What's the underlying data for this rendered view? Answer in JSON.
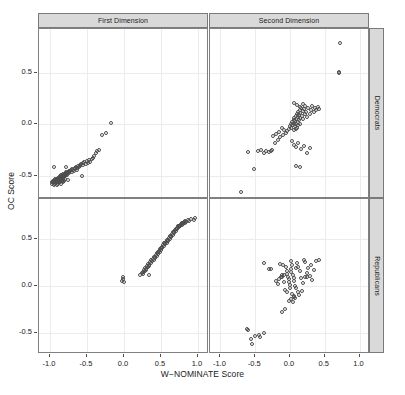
{
  "chart_data": {
    "type": "scatter",
    "title": "",
    "xlabel": "W−NOMINATE Score",
    "ylabel": "OC Score",
    "xlim": [
      -1.15,
      1.15
    ],
    "ylim": [
      -0.72,
      0.92
    ],
    "grid": true,
    "legend": null,
    "layout": {
      "rows": 2,
      "cols": 2,
      "col_strips": [
        "First Dimension",
        "Second Dimension"
      ],
      "row_strips": [
        "Democrats",
        "Republicans"
      ]
    },
    "xticks": [
      -1.0,
      -0.5,
      0.0,
      0.5,
      1.0
    ],
    "xtick_labels": [
      "-1.0",
      "-0.5",
      "0.0",
      "0.5",
      "1.0"
    ],
    "yticks": [
      0.5,
      0.0,
      -0.5
    ],
    "ytick_labels": [
      "0.5",
      "0.0",
      "-0.5"
    ],
    "marker": "open-circle",
    "marker_color": "#4d4d4d",
    "panels": [
      {
        "row": 0,
        "col": 0,
        "row_label": "Democrats",
        "col_label": "First Dimension",
        "x": [
          -0.96,
          -0.95,
          -0.94,
          -0.94,
          -0.93,
          -0.93,
          -0.92,
          -0.92,
          -0.91,
          -0.91,
          -0.9,
          -0.9,
          -0.9,
          -0.89,
          -0.89,
          -0.88,
          -0.88,
          -0.88,
          -0.87,
          -0.87,
          -0.86,
          -0.86,
          -0.86,
          -0.85,
          -0.85,
          -0.85,
          -0.84,
          -0.84,
          -0.83,
          -0.83,
          -0.82,
          -0.82,
          -0.81,
          -0.81,
          -0.8,
          -0.8,
          -0.79,
          -0.79,
          -0.78,
          -0.78,
          -0.77,
          -0.77,
          -0.76,
          -0.75,
          -0.75,
          -0.74,
          -0.73,
          -0.72,
          -0.71,
          -0.7,
          -0.69,
          -0.68,
          -0.67,
          -0.66,
          -0.65,
          -0.64,
          -0.63,
          -0.62,
          -0.61,
          -0.6,
          -0.59,
          -0.58,
          -0.57,
          -0.56,
          -0.55,
          -0.54,
          -0.52,
          -0.5,
          -0.49,
          -0.47,
          -0.46,
          -0.44,
          -0.42,
          -0.4,
          -0.38,
          -0.36,
          -0.34,
          -0.3,
          -0.24,
          -0.98,
          -0.97,
          -0.96,
          -0.95,
          -0.94,
          -0.93,
          -0.92,
          -0.91,
          -0.9,
          -0.89,
          -0.88,
          -0.87,
          -0.86,
          -0.85,
          -0.84,
          -0.83,
          -0.82,
          -0.81,
          -0.8,
          -0.78,
          -0.76
        ],
        "y": [
          -0.56,
          -0.55,
          -0.57,
          -0.54,
          -0.55,
          -0.53,
          -0.56,
          -0.54,
          -0.55,
          -0.53,
          -0.54,
          -0.52,
          -0.56,
          -0.53,
          -0.55,
          -0.52,
          -0.54,
          -0.56,
          -0.51,
          -0.53,
          -0.52,
          -0.54,
          -0.5,
          -0.51,
          -0.53,
          -0.49,
          -0.52,
          -0.5,
          -0.51,
          -0.49,
          -0.5,
          -0.48,
          -0.49,
          -0.51,
          -0.48,
          -0.5,
          -0.47,
          -0.49,
          -0.48,
          -0.46,
          -0.47,
          -0.49,
          -0.46,
          -0.47,
          -0.45,
          -0.46,
          -0.45,
          -0.44,
          -0.46,
          -0.43,
          -0.44,
          -0.45,
          -0.42,
          -0.43,
          -0.41,
          -0.44,
          -0.42,
          -0.4,
          -0.41,
          -0.39,
          -0.4,
          -0.38,
          -0.5,
          -0.37,
          -0.39,
          -0.36,
          -0.38,
          -0.35,
          -0.37,
          -0.34,
          -0.36,
          -0.33,
          -0.32,
          -0.3,
          -0.28,
          -0.26,
          -0.25,
          -0.1,
          -0.08,
          -0.57,
          -0.56,
          -0.55,
          -0.58,
          -0.56,
          -0.57,
          -0.55,
          -0.58,
          -0.56,
          -0.57,
          -0.55,
          -0.56,
          -0.54,
          -0.57,
          -0.55,
          -0.56,
          -0.54,
          -0.55,
          -0.53,
          -0.41,
          -0.54
        ],
        "extra_points": [
          {
            "x": -0.17,
            "y": 0.01
          },
          {
            "x": -0.95,
            "y": -0.41
          }
        ]
      },
      {
        "row": 0,
        "col": 1,
        "row_label": "Democrats",
        "col_label": "Second Dimension",
        "x": [
          -0.04,
          -0.02,
          0.0,
          0.01,
          0.02,
          0.03,
          0.04,
          0.05,
          0.05,
          0.06,
          0.06,
          0.07,
          0.07,
          0.08,
          0.08,
          0.09,
          0.09,
          0.1,
          0.1,
          0.11,
          0.11,
          0.12,
          0.12,
          0.13,
          0.13,
          0.14,
          0.14,
          0.15,
          0.15,
          0.16,
          0.17,
          0.18,
          0.19,
          0.2,
          0.21,
          0.22,
          0.23,
          0.24,
          0.26,
          0.28,
          0.3,
          0.32,
          0.34,
          0.36,
          0.38,
          0.4,
          0.42,
          -0.06,
          -0.08,
          -0.1,
          -0.12,
          -0.14,
          -0.16,
          -0.18,
          -0.2,
          -0.22,
          -0.24,
          -0.26,
          -0.28,
          -0.3,
          -0.34,
          -0.38,
          -0.42,
          -0.46,
          -0.52,
          -0.6,
          -0.7,
          0.03,
          0.05,
          0.09,
          0.12,
          0.16,
          0.2,
          0.24,
          0.28,
          0.06,
          0.1,
          0.14,
          0.18,
          0.08
        ],
        "y": [
          -0.06,
          -0.04,
          -0.02,
          0.0,
          -0.03,
          0.02,
          -0.01,
          0.04,
          -0.05,
          0.01,
          0.06,
          -0.02,
          0.03,
          0.08,
          -0.04,
          0.05,
          0.0,
          0.1,
          -0.03,
          0.07,
          0.02,
          0.12,
          -0.01,
          0.09,
          0.04,
          0.14,
          0.0,
          0.11,
          0.06,
          0.16,
          0.08,
          0.13,
          0.05,
          0.15,
          0.1,
          0.18,
          0.12,
          0.07,
          0.16,
          0.1,
          0.14,
          0.18,
          0.12,
          0.16,
          0.14,
          0.17,
          0.15,
          -0.08,
          -0.05,
          -0.1,
          -0.03,
          -0.12,
          -0.07,
          -0.15,
          -0.09,
          -0.18,
          -0.11,
          -0.25,
          -0.26,
          -0.27,
          -0.26,
          -0.28,
          -0.25,
          -0.26,
          -0.43,
          -0.27,
          -0.65,
          -0.16,
          -0.2,
          -0.22,
          -0.18,
          -0.24,
          -0.21,
          -0.28,
          -0.23,
          0.21,
          0.19,
          0.17,
          0.2,
          -0.4
        ],
        "extra_points": [
          {
            "x": 0.72,
            "y": 0.79
          },
          {
            "x": 0.7,
            "y": 0.51
          },
          {
            "x": 0.7,
            "y": 0.5
          },
          {
            "x": 0.14,
            "y": -0.41
          }
        ]
      },
      {
        "row": 1,
        "col": 0,
        "row_label": "Republicans",
        "col_label": "First Dimension",
        "x": [
          0.22,
          0.24,
          0.26,
          0.27,
          0.28,
          0.29,
          0.3,
          0.31,
          0.32,
          0.33,
          0.34,
          0.35,
          0.36,
          0.37,
          0.38,
          0.39,
          0.4,
          0.41,
          0.42,
          0.43,
          0.44,
          0.45,
          0.46,
          0.47,
          0.48,
          0.49,
          0.5,
          0.51,
          0.52,
          0.53,
          0.54,
          0.55,
          0.56,
          0.57,
          0.58,
          0.59,
          0.6,
          0.61,
          0.62,
          0.63,
          0.64,
          0.65,
          0.66,
          0.67,
          0.68,
          0.69,
          0.7,
          0.71,
          0.72,
          0.73,
          0.74,
          0.75,
          0.76,
          0.77,
          0.78,
          0.79,
          0.8,
          0.81,
          0.82,
          0.83,
          0.84,
          0.86,
          0.88,
          0.9,
          0.94,
          0.96,
          0.26,
          0.3,
          0.34,
          0.38,
          0.42,
          0.46,
          0.5,
          0.54,
          0.58,
          0.62,
          0.66,
          0.7,
          0.74,
          0.78
        ],
        "y": [
          0.12,
          0.14,
          0.15,
          0.17,
          0.16,
          0.19,
          0.18,
          0.21,
          0.2,
          0.23,
          0.22,
          0.25,
          0.24,
          0.27,
          0.26,
          0.29,
          0.28,
          0.31,
          0.3,
          0.33,
          0.32,
          0.35,
          0.34,
          0.37,
          0.36,
          0.39,
          0.38,
          0.41,
          0.4,
          0.43,
          0.42,
          0.45,
          0.44,
          0.47,
          0.46,
          0.49,
          0.48,
          0.51,
          0.5,
          0.53,
          0.52,
          0.55,
          0.54,
          0.57,
          0.56,
          0.59,
          0.58,
          0.61,
          0.6,
          0.63,
          0.62,
          0.64,
          0.63,
          0.66,
          0.65,
          0.67,
          0.66,
          0.68,
          0.67,
          0.69,
          0.68,
          0.7,
          0.69,
          0.71,
          0.7,
          0.72,
          0.13,
          0.17,
          0.21,
          0.26,
          0.31,
          0.36,
          0.4,
          0.45,
          0.49,
          0.53,
          0.57,
          0.6,
          0.64,
          0.67
        ],
        "extra_points": [
          {
            "x": -0.02,
            "y": 0.07
          },
          {
            "x": -0.01,
            "y": 0.1
          },
          {
            "x": -0.03,
            "y": 0.05
          },
          {
            "x": 0.0,
            "y": 0.04
          },
          {
            "x": 0.34,
            "y": 0.12
          }
        ]
      },
      {
        "row": 1,
        "col": 1,
        "row_label": "Republicans",
        "col_label": "Second Dimension",
        "x": [
          -0.38,
          -0.3,
          -0.28,
          -0.15,
          -0.13,
          -0.11,
          -0.1,
          -0.08,
          -0.06,
          -0.05,
          -0.04,
          -0.03,
          -0.02,
          -0.01,
          0.0,
          0.0,
          0.01,
          0.02,
          0.02,
          0.03,
          0.04,
          0.05,
          0.06,
          0.07,
          0.08,
          0.1,
          0.12,
          0.14,
          0.16,
          0.18,
          0.2,
          0.22,
          0.24,
          0.26,
          0.28,
          0.3,
          0.32,
          0.34,
          0.38,
          0.42,
          -0.2,
          -0.18,
          -0.16,
          -0.12,
          -0.09,
          -0.07,
          -0.05,
          0.03,
          0.05,
          0.07,
          0.09,
          0.11,
          0.13,
          0.17,
          0.21,
          0.25,
          -0.02,
          0.01,
          0.04,
          0.06
        ],
        "y": [
          0.24,
          0.18,
          0.18,
          0.23,
          0.09,
          0.09,
          0.22,
          0.12,
          0.2,
          0.16,
          0.13,
          0.1,
          0.07,
          0.04,
          0.01,
          -0.02,
          0.18,
          0.15,
          0.26,
          0.22,
          0.12,
          0.08,
          0.05,
          0.0,
          0.19,
          0.24,
          0.2,
          0.16,
          0.08,
          0.03,
          0.28,
          0.25,
          0.14,
          0.19,
          0.11,
          0.22,
          0.06,
          0.17,
          0.26,
          0.27,
          0.05,
          0.02,
          0.07,
          0.12,
          0.04,
          -0.04,
          -0.06,
          -0.08,
          -0.11,
          -0.13,
          -0.02,
          -0.06,
          -0.09,
          -0.05,
          0.1,
          0.09,
          -0.16,
          -0.14,
          -0.17,
          -0.12
        ],
        "extra_points": [
          {
            "x": -0.62,
            "y": -0.46
          },
          {
            "x": -0.61,
            "y": -0.47
          },
          {
            "x": -0.56,
            "y": -0.56
          },
          {
            "x": -0.5,
            "y": -0.53
          },
          {
            "x": -0.44,
            "y": -0.52
          },
          {
            "x": -0.43,
            "y": -0.54
          },
          {
            "x": -0.38,
            "y": -0.5
          },
          {
            "x": -0.54,
            "y": -0.61
          },
          {
            "x": -0.12,
            "y": -0.28
          },
          {
            "x": -0.07,
            "y": -0.24
          }
        ]
      }
    ]
  }
}
